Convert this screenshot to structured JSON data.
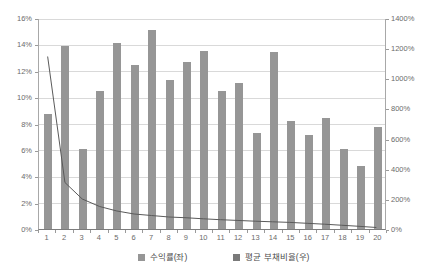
{
  "chart_data": {
    "type": "bar",
    "title": "",
    "subtitle": "",
    "xlabel": "",
    "ylabel": "",
    "y2label": "",
    "grid": true,
    "legend_position": "bottom",
    "categories": [
      "1",
      "2",
      "3",
      "4",
      "5",
      "6",
      "7",
      "8",
      "9",
      "10",
      "11",
      "12",
      "13",
      "14",
      "15",
      "16",
      "17",
      "18",
      "19",
      "20"
    ],
    "ylim": [
      0,
      16
    ],
    "y2lim": [
      0,
      1400
    ],
    "yticks": [
      0,
      2,
      4,
      6,
      8,
      10,
      12,
      14,
      16
    ],
    "ytick_labels": [
      "0%",
      "2%",
      "4%",
      "6%",
      "8%",
      "10%",
      "12%",
      "14%",
      "16%"
    ],
    "y2ticks": [
      0,
      200,
      400,
      600,
      800,
      1000,
      1200,
      1400
    ],
    "y2tick_labels": [
      "0%",
      "200%",
      "400%",
      "600%",
      "800%",
      "1000%",
      "1200%",
      "1400%"
    ],
    "series": [
      {
        "name": "수익률(좌)",
        "type": "bar",
        "axis": "left",
        "color": "#969696",
        "values": [
          8.7,
          13.9,
          6.1,
          10.5,
          14.1,
          12.4,
          15.1,
          11.3,
          12.7,
          13.5,
          10.5,
          11.1,
          7.3,
          13.4,
          8.2,
          7.1,
          8.4,
          6.1,
          4.8,
          7.7
        ]
      },
      {
        "name": "평균 부채비율(우)",
        "type": "line",
        "axis": "right",
        "color": "#595959",
        "values": [
          1150,
          310,
          200,
          150,
          120,
          100,
          90,
          80,
          75,
          68,
          62,
          57,
          52,
          48,
          44,
          38,
          32,
          25,
          18,
          10
        ]
      }
    ]
  },
  "legend": {
    "items": [
      {
        "label": "수익률(좌)",
        "color": "#969696",
        "swatch_name": "legend-swatch-revenue"
      },
      {
        "label": "평균 부채비율(우)",
        "color": "#7a7a7a",
        "swatch_name": "legend-swatch-debt"
      }
    ]
  },
  "colors": {
    "bar": "#969696",
    "line": "#595959",
    "grid": "#d9d9d9",
    "axis": "#a8a8a8",
    "text": "#6b6b6b",
    "background": "#ffffff"
  }
}
